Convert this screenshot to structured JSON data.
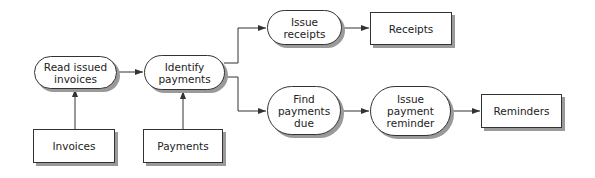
{
  "diagram": {
    "type": "data-flow",
    "nodes": [
      {
        "id": "read_issued_invoices",
        "label": "Read issued\ninvoices",
        "kind": "process"
      },
      {
        "id": "identify_payments",
        "label": "Identify\npayments",
        "kind": "process"
      },
      {
        "id": "issue_receipts",
        "label": "Issue\nreceipts",
        "kind": "process"
      },
      {
        "id": "receipts",
        "label": "Receipts",
        "kind": "data"
      },
      {
        "id": "find_payments_due",
        "label": "Find\npayments\ndue",
        "kind": "process"
      },
      {
        "id": "issue_payment_reminder",
        "label": "Issue\npayment\nreminder",
        "kind": "process"
      },
      {
        "id": "reminders",
        "label": "Reminders",
        "kind": "data"
      },
      {
        "id": "invoices",
        "label": "Invoices",
        "kind": "data"
      },
      {
        "id": "payments",
        "label": "Payments",
        "kind": "data"
      }
    ],
    "edges": [
      {
        "from": "invoices",
        "to": "read_issued_invoices"
      },
      {
        "from": "read_issued_invoices",
        "to": "identify_payments"
      },
      {
        "from": "payments",
        "to": "identify_payments"
      },
      {
        "from": "identify_payments",
        "to": "issue_receipts"
      },
      {
        "from": "identify_payments",
        "to": "find_payments_due"
      },
      {
        "from": "issue_receipts",
        "to": "receipts"
      },
      {
        "from": "find_payments_due",
        "to": "issue_payment_reminder"
      },
      {
        "from": "issue_payment_reminder",
        "to": "reminders"
      }
    ]
  },
  "colors": {
    "stroke": "#333333",
    "shadow": "#9a9a9a",
    "fill": "#ffffff"
  }
}
